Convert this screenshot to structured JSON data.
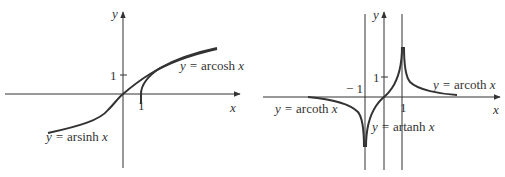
{
  "left_panel": {
    "y_axis_label": "y",
    "x_axis_label": "x",
    "y_tick": "1",
    "x_tick": "1",
    "curves": [
      {
        "name": "arsinh",
        "label_prefix": "y = ",
        "label_func": "arsinh ",
        "label_var": "x"
      },
      {
        "name": "arcosh",
        "label_prefix": "y = ",
        "label_func": "arcosh ",
        "label_var": "x"
      }
    ]
  },
  "right_panel": {
    "y_axis_label": "y",
    "x_axis_label": "x",
    "y_tick": "1",
    "x_tick_pos": "1",
    "x_tick_neg": "− 1",
    "curves": [
      {
        "name": "arcoth-left",
        "label_prefix": "y = ",
        "label_func": "arcoth ",
        "label_var": "x"
      },
      {
        "name": "arcoth-right",
        "label_prefix": "y = ",
        "label_func": "arcoth ",
        "label_var": "x"
      },
      {
        "name": "artanh",
        "label_prefix": "y = ",
        "label_func": "artanh ",
        "label_var": "x"
      }
    ]
  },
  "colors": {
    "ink": "#333333",
    "background": "#ffffff"
  }
}
